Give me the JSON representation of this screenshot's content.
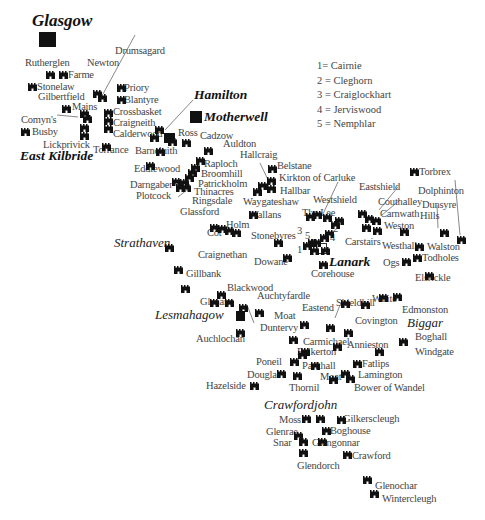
{
  "map_title": "Castles of Lanarkshire",
  "legend": [
    "1= Cairnie",
    "2 = Cleghorn",
    "3 = Craiglockhart",
    "4 = Jerviswood",
    "5 = Nemphlar"
  ],
  "towns": {
    "glasgow": "Glasgow",
    "hamilton": "Hamilton",
    "motherwell": "Motherwell",
    "east_kilbride": "East Kilbride",
    "strathaven": "Strathaven",
    "lanark": "Lanark",
    "lesmahagow": "Lesmahagow",
    "biggar": "Biggar",
    "crawfordjohn": "Crawfordjohn"
  },
  "sites": {
    "rutherglen": "Rutherglen",
    "farme": "Farme",
    "newton": "Newton",
    "drumsagard": "Drumsagard",
    "stonelaw": "Stonelaw",
    "gilbertfield": "Gilbertfield",
    "priory": "Priory",
    "blantyre": "Blantyre",
    "mains": "Mains",
    "crossbasket": "Crossbasket",
    "comyns": "Comyn's",
    "craigneith": "Craigneith",
    "busby": "Busby",
    "calderwood": "Calderwood",
    "lickprivick": "Lickprivick",
    "torrance": "Torrance",
    "ross": "Ross",
    "cadzow": "Cadzow",
    "barncluith": "Barncluith",
    "auldton": "Auldton",
    "hallcraig": "Hallcraig",
    "eddlewood": "Eddlewood",
    "raploch": "Raploch",
    "broomhill": "Broomhill",
    "belstane": "Belstane",
    "darngaber": "Darngaber",
    "patrickholm": "Patrickholm",
    "kirkton": "Kirkton of Carluke",
    "plotcock": "Plotcock",
    "thinacres": "Thinacres",
    "hallbar": "Hallbar",
    "ringsdale": "Ringsdale",
    "waygateshaw": "Waygateshaw",
    "glassford": "Glassford",
    "wallans": "Wallans",
    "holm": "Holm",
    "cot": "Cot",
    "westshield": "Westshield",
    "eastshield": "Eastshield",
    "the_lee": "The Lee",
    "couthalley": "Couthalley",
    "carnwath": "Carnwath",
    "weston": "Weston",
    "carstairs": "Carstairs",
    "torbrex": "Torbrex",
    "dolphinton": "Dolphinton",
    "dunsyre": "Dunsyre",
    "hills": "Hills",
    "westhall": "Westhall",
    "walston": "Walston",
    "todholes": "Todholes",
    "ogs": "Ogs",
    "elsrickle": "Elsrickle",
    "stonebyres": "Stonebyres",
    "dowane": "Dowane",
    "corehouse": "Corehouse",
    "craignethan": "Craignethan",
    "gillbank": "Gillbank",
    "blackwood": "Blackwood",
    "glenane": "Glenane",
    "auchtyfardle": "Auchtyfardle",
    "moat1": "Moat",
    "duntervy": "Duntervy",
    "auchlochan": "Auchlochan",
    "eastend": "Eastend",
    "shieldhill": "Shieldhill",
    "white": "White",
    "edmonston": "Edmonston",
    "covington": "Covington",
    "boghall": "Boghall",
    "carmichael": "Carmichael",
    "annieston": "Annieston",
    "folkerton": "Folkerton",
    "windgate": "Windgate",
    "poneil": "Poneil",
    "parkhall": "Parkhall",
    "fatlips": "Fatlips",
    "douglas": "Douglas",
    "moat2": "Moat",
    "lamington": "Lamington",
    "hazelside": "Hazelside",
    "thornil": "Thornil",
    "bower": "Bower of Wandel",
    "moss": "Moss",
    "gilkerscleugh": "Gilkerscleugh",
    "glenrae": "Glenrae",
    "boghouse": "Boghouse",
    "snar": "Snar",
    "glengonnar": "Glengonnar",
    "crawford": "Crawford",
    "glendorch": "Glendorch",
    "glenochar": "Glenochar",
    "wintercleugh": "Wintercleugh"
  },
  "numbers": {
    "n1": "1",
    "n2": "2",
    "n3": "3",
    "n4": "4",
    "n5": "5"
  },
  "colors": {
    "ink": "#111111",
    "text": "#444444",
    "background": "#ffffff"
  }
}
